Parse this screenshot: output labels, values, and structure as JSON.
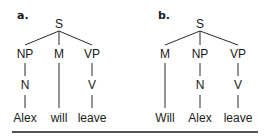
{
  "trees": [
    {
      "label": "a.",
      "root": "S",
      "phrases": [
        "NP",
        "M",
        "VP"
      ],
      "heads": [
        "N",
        "",
        "V"
      ],
      "words": [
        "Alex",
        "will",
        "leave"
      ]
    },
    {
      "label": "b.",
      "root": "S",
      "phrases": [
        "M",
        "NP",
        "VP"
      ],
      "heads": [
        "",
        "N",
        "V"
      ],
      "words": [
        "Will",
        "Alex",
        "leave"
      ]
    }
  ]
}
